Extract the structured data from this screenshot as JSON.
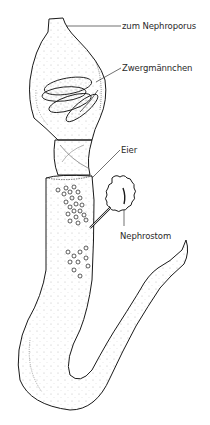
{
  "figure": {
    "colors": {
      "ink": "#1a1a1a",
      "stipple": "#555555",
      "background": "#ffffff"
    }
  },
  "labels": [
    {
      "id": "nephroporus",
      "text": "zum Nephroporus",
      "x": 123,
      "y": 22
    },
    {
      "id": "zwergmaennchen",
      "text": "Zwergmännchen",
      "x": 123,
      "y": 64
    },
    {
      "id": "eier",
      "text": "Eier",
      "x": 122,
      "y": 146
    },
    {
      "id": "nephrostom",
      "text": "Nephrostom",
      "x": 121,
      "y": 232
    }
  ]
}
